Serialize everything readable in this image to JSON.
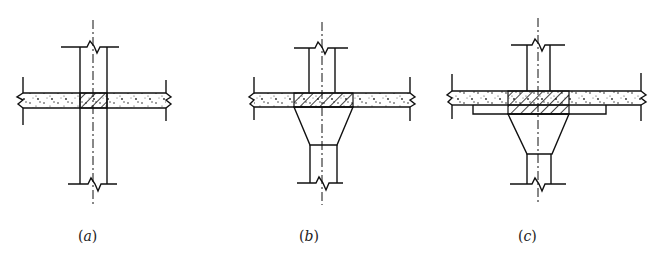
{
  "figure": {
    "colors": {
      "line": "#111111",
      "background": "#ffffff"
    },
    "panels": [
      {
        "id": "a",
        "caption": "(a)",
        "caption_letter": "a",
        "type": "no capital"
      },
      {
        "id": "b",
        "caption": "(b)",
        "caption_letter": "b",
        "type": "column capital"
      },
      {
        "id": "c",
        "caption": "(c)",
        "caption_letter": "c",
        "type": "column capital with drop panel"
      }
    ]
  }
}
